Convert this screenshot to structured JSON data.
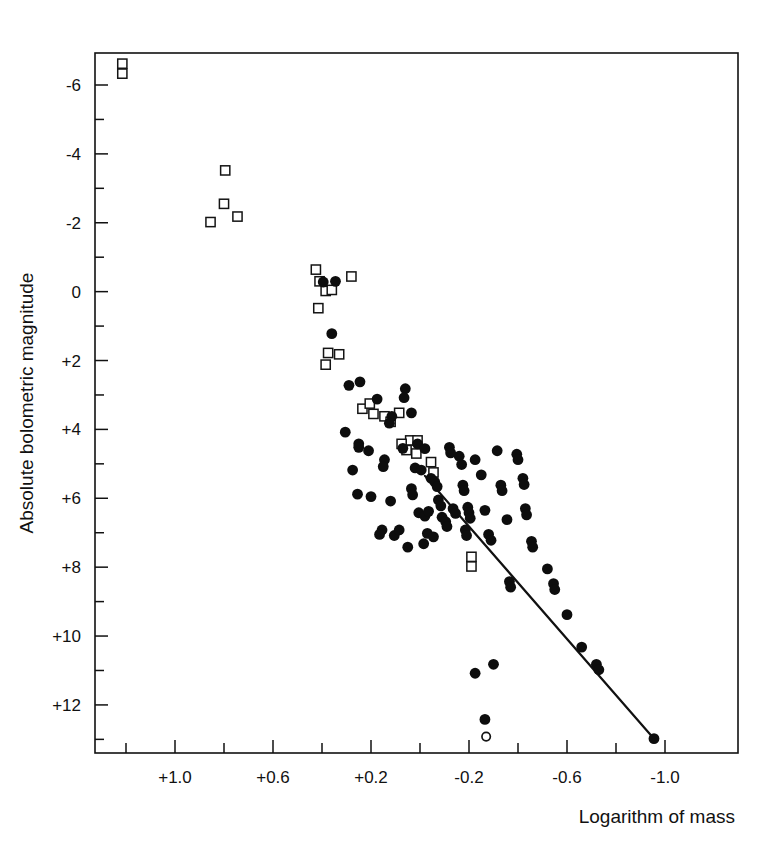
{
  "chart_data": {
    "type": "scatter",
    "title": "",
    "subtitle": "",
    "xlabel": "Logarithm of mass",
    "ylabel": "Absolute bolometric magnitude",
    "grid": false,
    "legend_position": "none",
    "xlim": [
      1.3,
      -1.13
    ],
    "ylim": [
      -6.8,
      13.45
    ],
    "x_inverted": true,
    "y_inverted": true,
    "xticks": [
      1.0,
      0.6,
      0.2,
      -0.2,
      -0.6,
      -1.0
    ],
    "xtick_labels": [
      "+1.0",
      "+0.6",
      "+0.2",
      "-0.2",
      "-0.6",
      "-1.0"
    ],
    "xminor_step": 0.2,
    "yticks": [
      -6,
      -4,
      -2,
      0,
      2,
      4,
      6,
      8,
      10,
      12
    ],
    "ytick_labels": [
      "-6",
      "-4",
      "-2",
      "0",
      "+2",
      "+4",
      "+6",
      "+8",
      "+10",
      "+12"
    ],
    "yminor_step": 1,
    "marker_colors": {
      "filled_circle": "#0d0d0d",
      "open_square_stroke": "#141414",
      "open_square_fill": "#ffffff",
      "open_circle_stroke": "#141414",
      "line": "#111111"
    },
    "fit_line": {
      "label": "mass-luminosity relation",
      "x_start": -0.02,
      "y_start": 5.35,
      "x_end": -0.955,
      "y_end": 12.98
    },
    "series": [
      {
        "name": "open squares",
        "marker": "open-square",
        "points": [
          [
            1.215,
            -6.33
          ],
          [
            1.215,
            -6.62
          ],
          [
            0.795,
            -3.52
          ],
          [
            0.8,
            -2.55
          ],
          [
            0.745,
            -2.18
          ],
          [
            0.855,
            -2.02
          ],
          [
            0.425,
            -0.64
          ],
          [
            0.385,
            -0.02
          ],
          [
            0.36,
            -0.05
          ],
          [
            0.28,
            -0.44
          ],
          [
            0.41,
            -0.3
          ],
          [
            0.415,
            0.48
          ],
          [
            0.33,
            1.82
          ],
          [
            0.375,
            1.78
          ],
          [
            0.385,
            2.12
          ],
          [
            0.235,
            3.4
          ],
          [
            0.205,
            3.25
          ],
          [
            0.19,
            3.55
          ],
          [
            0.145,
            3.62
          ],
          [
            0.12,
            3.78
          ],
          [
            0.085,
            3.52
          ],
          [
            0.04,
            4.32
          ],
          [
            0.075,
            4.42
          ],
          [
            0.055,
            4.6
          ],
          [
            0.01,
            4.32
          ],
          [
            0.015,
            4.7
          ],
          [
            -0.045,
            4.95
          ],
          [
            -0.055,
            5.25
          ],
          [
            -0.21,
            7.7
          ],
          [
            -0.21,
            7.98
          ]
        ]
      },
      {
        "name": "filled circles",
        "marker": "filled-circle",
        "points": [
          [
            0.395,
            -0.28
          ],
          [
            0.345,
            -0.3
          ],
          [
            0.36,
            1.22
          ],
          [
            0.245,
            2.62
          ],
          [
            0.29,
            2.72
          ],
          [
            0.175,
            3.12
          ],
          [
            0.115,
            3.62
          ],
          [
            0.125,
            3.82
          ],
          [
            0.06,
            2.82
          ],
          [
            0.035,
            3.52
          ],
          [
            0.305,
            4.08
          ],
          [
            0.25,
            4.42
          ],
          [
            0.25,
            4.52
          ],
          [
            0.275,
            5.18
          ],
          [
            0.255,
            5.88
          ],
          [
            0.145,
            4.88
          ],
          [
            0.15,
            5.08
          ],
          [
            0.065,
            3.08
          ],
          [
            0.07,
            4.55
          ],
          [
            0.01,
            4.42
          ],
          [
            -0.02,
            4.56
          ],
          [
            0.02,
            5.12
          ],
          [
            -0.005,
            5.18
          ],
          [
            0.035,
            5.72
          ],
          [
            0.03,
            5.9
          ],
          [
            0.12,
            6.08
          ],
          [
            0.005,
            6.42
          ],
          [
            -0.02,
            6.52
          ],
          [
            -0.035,
            6.38
          ],
          [
            -0.045,
            5.42
          ],
          [
            -0.06,
            5.52
          ],
          [
            -0.07,
            5.66
          ],
          [
            -0.075,
            6.05
          ],
          [
            -0.085,
            6.22
          ],
          [
            -0.09,
            6.55
          ],
          [
            -0.105,
            6.68
          ],
          [
            -0.11,
            6.82
          ],
          [
            -0.03,
            7.02
          ],
          [
            -0.055,
            7.12
          ],
          [
            -0.135,
            6.3
          ],
          [
            -0.145,
            6.44
          ],
          [
            -0.16,
            4.78
          ],
          [
            -0.17,
            5.02
          ],
          [
            -0.175,
            5.62
          ],
          [
            -0.18,
            5.78
          ],
          [
            -0.195,
            6.26
          ],
          [
            -0.2,
            6.42
          ],
          [
            -0.205,
            6.58
          ],
          [
            -0.185,
            6.92
          ],
          [
            -0.19,
            7.08
          ],
          [
            -0.225,
            4.88
          ],
          [
            -0.25,
            5.32
          ],
          [
            -0.265,
            6.35
          ],
          [
            -0.28,
            7.05
          ],
          [
            -0.29,
            7.22
          ],
          [
            -0.315,
            4.62
          ],
          [
            -0.33,
            5.62
          ],
          [
            -0.335,
            5.78
          ],
          [
            -0.355,
            6.62
          ],
          [
            -0.395,
            4.72
          ],
          [
            -0.4,
            4.88
          ],
          [
            -0.42,
            5.42
          ],
          [
            -0.425,
            5.6
          ],
          [
            -0.43,
            6.3
          ],
          [
            -0.435,
            6.48
          ],
          [
            -0.455,
            7.25
          ],
          [
            -0.46,
            7.42
          ],
          [
            -0.365,
            8.42
          ],
          [
            -0.37,
            8.58
          ],
          [
            -0.3,
            10.82
          ],
          [
            -0.52,
            8.05
          ],
          [
            -0.545,
            8.48
          ],
          [
            -0.55,
            8.65
          ],
          [
            -0.6,
            9.38
          ],
          [
            -0.66,
            10.32
          ],
          [
            -0.72,
            10.82
          ],
          [
            -0.73,
            10.98
          ],
          [
            -0.225,
            11.08
          ],
          [
            -0.265,
            12.42
          ],
          [
            -0.955,
            12.98
          ],
          [
            0.155,
            6.92
          ],
          [
            0.165,
            7.05
          ],
          [
            0.105,
            7.08
          ],
          [
            0.21,
            4.62
          ],
          [
            0.2,
            5.95
          ],
          [
            0.085,
            6.92
          ],
          [
            -0.12,
            4.52
          ],
          [
            -0.125,
            4.68
          ],
          [
            -0.015,
            7.32
          ],
          [
            0.05,
            7.42
          ]
        ]
      },
      {
        "name": "open circle",
        "marker": "open-circle",
        "points": [
          [
            -0.27,
            12.92
          ]
        ]
      }
    ]
  },
  "geometry": {
    "plot_left": 95,
    "plot_right": 738,
    "plot_top": 53,
    "plot_bottom": 753,
    "x_at_plus_one": 175,
    "px_per_0p2_x": 49,
    "y_at_minus_six": 85,
    "px_per_mag": 34.44
  }
}
